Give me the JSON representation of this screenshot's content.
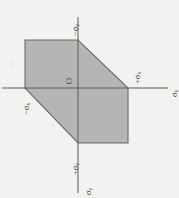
{
  "figure": {
    "background_color": "#f2f2f0",
    "fill_color": "#b5b5b3",
    "stroke_color": "#6b6b6b",
    "axis_color": "#5a5a5a",
    "text_color": "#3a3a3a",
    "origin_label": "O",
    "orientation_note": "all text rotated 90 degrees counter-clockwise"
  },
  "axes": {
    "horizontal": {
      "name": "sigma-x-axis",
      "axis_label": "σₓ",
      "positive_label": "+σₓ",
      "negative_label": "−σₓ"
    },
    "vertical": {
      "name": "sigma-y-axis",
      "axis_label": "σᵧ",
      "positive_label": "+σᵧ",
      "negative_label": "−σᵧ"
    }
  },
  "labels": {
    "top": "−σᵧ",
    "right_inner": "+σₓ",
    "right_axis": "σₓ",
    "left": "−σₓ",
    "bottom_inner": "+σᵧ",
    "bottom_axis": "σᵧ",
    "origin": "O"
  },
  "chart_data": {
    "type": "line",
    "xlabel": "σₓ",
    "ylabel": "σᵧ",
    "grid": false,
    "legend": null,
    "xlim": [
      -1.4,
      1.4
    ],
    "ylim": [
      -1.4,
      1.4
    ],
    "annotations": [
      {
        "text": "O",
        "x": 0,
        "y": 0
      },
      {
        "text": "−σᵧ",
        "x": 0,
        "y": 1
      },
      {
        "text": "+σₓ",
        "x": 1,
        "y": 0
      },
      {
        "text": "−σₓ",
        "x": -1,
        "y": 0
      },
      {
        "text": "+σᵧ",
        "x": 0,
        "y": -1
      },
      {
        "text": "σₓ",
        "x": 1.35,
        "y": 0
      },
      {
        "text": "σᵧ",
        "x": 0,
        "y": -1.35
      }
    ],
    "series": [
      {
        "name": "yield-locus",
        "closed": true,
        "fill": "#b5b5b3",
        "x": [
          -1,
          0,
          1,
          1,
          0,
          -1
        ],
        "y": [
          1,
          1,
          0,
          -1,
          -1,
          0
        ]
      }
    ]
  },
  "vertices_px": [
    {
      "name": "top-left",
      "x": 25,
      "y": 40
    },
    {
      "name": "top-right",
      "x": 78,
      "y": 40
    },
    {
      "name": "right",
      "x": 128,
      "y": 88
    },
    {
      "name": "bottom-right",
      "x": 128,
      "y": 143
    },
    {
      "name": "bottom-left",
      "x": 78,
      "y": 143
    },
    {
      "name": "left",
      "x": 25,
      "y": 88
    }
  ]
}
